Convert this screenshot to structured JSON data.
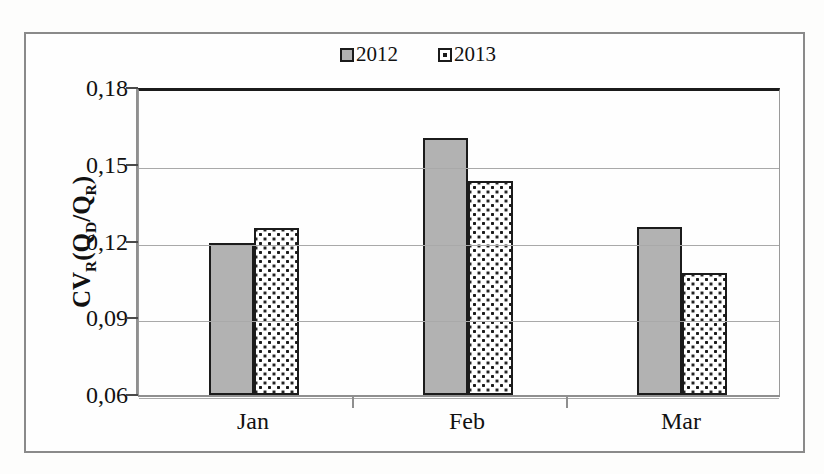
{
  "chart_data": {
    "type": "bar",
    "title": "",
    "xlabel": "",
    "ylabel": "CV_R(Q_D/Q_R)",
    "ylabel_parts": {
      "main": "CV",
      "main_sub": "R",
      "open": "(Q",
      "num_sub": "D",
      "slash": "/Q",
      "den_sub": "R",
      "close": ")"
    },
    "categories": [
      "Jan",
      "Feb",
      "Mar"
    ],
    "series": [
      {
        "name": "2012",
        "values": [
          0.1195,
          0.1605,
          0.1255
        ],
        "fill": "solid-gray"
      },
      {
        "name": "2013",
        "values": [
          0.1252,
          0.1435,
          0.1075
        ],
        "fill": "dotted"
      }
    ],
    "ylim": [
      0.06,
      0.18
    ],
    "yticks": [
      0.06,
      0.09,
      0.12,
      0.15,
      0.18
    ],
    "ytick_labels": [
      "0,06",
      "0,09",
      "0,12",
      "0,15",
      "0,18"
    ],
    "decimal_separator": ",",
    "grid": true,
    "grid_axis": "y",
    "legend_position": "top-center"
  },
  "legend": {
    "items": [
      {
        "label": "2012",
        "swatch": "solid-gray-square-icon"
      },
      {
        "label": "2013",
        "swatch": "dotted-square-icon"
      }
    ]
  },
  "colors": {
    "series_2012_fill": "#b2b2b2",
    "series_2013_fill": "#ffffff",
    "bar_outline": "#1b1b1b",
    "gridline": "#a9a9a9",
    "axis": "#8f8f8f",
    "frame": "#8a8a8a",
    "text": "#111111",
    "background": "#fdfdfc"
  }
}
